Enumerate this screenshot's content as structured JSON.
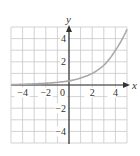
{
  "chart_data": {
    "type": "line",
    "title": "",
    "xlabel": "x",
    "ylabel": "y",
    "xlim": [
      -5,
      5
    ],
    "ylim": [
      -5,
      5
    ],
    "grid": true,
    "x_ticks": [
      -4,
      -2,
      0,
      2,
      4
    ],
    "y_ticks": [
      4,
      2,
      -2,
      -4
    ],
    "x_tick_labels": [
      "−4",
      "−2",
      "0",
      "2",
      "4"
    ],
    "y_tick_labels": [
      "4",
      "2",
      "−2",
      "−4"
    ],
    "series": [
      {
        "name": "curve",
        "x": [
          -5,
          -4,
          -3,
          -2,
          -1,
          0,
          1,
          2,
          3,
          4,
          5
        ],
        "y": [
          0.03,
          0.06,
          0.1,
          0.15,
          0.23,
          0.35,
          0.6,
          1.0,
          1.7,
          3.0,
          4.8
        ]
      }
    ],
    "colors": {
      "grid": "#c8c8c8",
      "axes": "#333333",
      "curve": "#a9a9a9"
    }
  }
}
